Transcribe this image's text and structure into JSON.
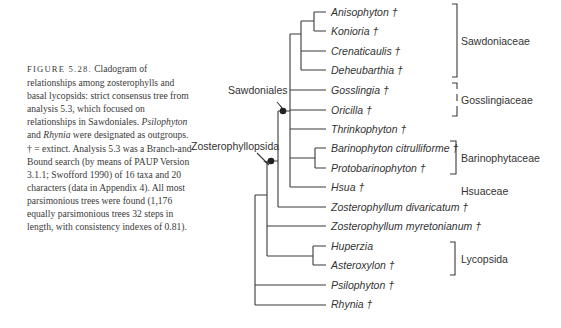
{
  "caption": {
    "figure_label": "FIGURE 5.28.",
    "text_1": " Cladogram of relationships among zosterophylls and basal lycopsids: strict consensus tree from analysis 5.3, which focused on relationships in Sawdoniales. ",
    "italic_1": "Psilophyton",
    "text_2": " and ",
    "italic_2": "Rhynia",
    "text_3": " were designated as outgroups. † = extinct. Analysis 5.3 was a Branch-and-Bound search (by means of PAUP Version 3.1.1; Swofford 1990) of 16 taxa and 20 characters (data in Appendix 4). All most parsimonious trees were found (1,176 equally parsimonious trees 32 steps in length, with consistency indexes of 0.81)."
  },
  "taxa": [
    {
      "name": "Anisophyton †",
      "y": 12
    },
    {
      "name": "Konioria †",
      "y": 31
    },
    {
      "name": "Crenaticaulis †",
      "y": 51
    },
    {
      "name": "Deheubarthia †",
      "y": 70
    },
    {
      "name": "Gosslingia †",
      "y": 90
    },
    {
      "name": "Oricilla †",
      "y": 110
    },
    {
      "name": "Thrinkophyton †",
      "y": 129
    },
    {
      "name": "Barinophyton citrulliforme †",
      "y": 148
    },
    {
      "name": "Protobarinophyton †",
      "y": 168
    },
    {
      "name": "Hsua †",
      "y": 187
    },
    {
      "name": "Zosterophyllum divaricatum †",
      "y": 207
    },
    {
      "name": "Zosterophyllum myretonianum †",
      "y": 226
    },
    {
      "name": "Huperzia",
      "y": 246
    },
    {
      "name": "Asteroxylon †",
      "y": 265
    },
    {
      "name": "Psilophyton †",
      "y": 285
    },
    {
      "name": "Rhynia †",
      "y": 304
    }
  ],
  "node_labels": {
    "sawdoniales": "Sawdoniales",
    "zosterophyllopsida": "Zosterophyllopsida"
  },
  "groups": {
    "sawdoniaceae": "Sawdoniaceae",
    "gosslingiaceae": "Gosslingiaceae",
    "barinophytaceae": "Barinophytaceae",
    "hsuaceae": "Hsuaceae",
    "lycopsida": "Lycopsida"
  }
}
